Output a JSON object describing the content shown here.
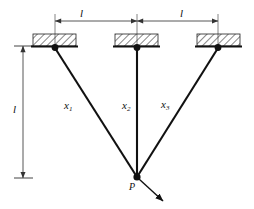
{
  "figure": {
    "type": "statics-diagram",
    "colors": {
      "line": "#111111",
      "background": "#ffffff",
      "dimension": "#555555",
      "hatch": "#222222"
    }
  },
  "dimensions": {
    "top_left_span_label": "l",
    "top_right_span_label": "l",
    "vertical_span_label": "l"
  },
  "members": [
    {
      "name": "bar-1",
      "label": "x",
      "subscript": "1"
    },
    {
      "name": "bar-2",
      "label": "x",
      "subscript": "2"
    },
    {
      "name": "bar-3",
      "label": "x",
      "subscript": "3"
    }
  ],
  "load": {
    "label": "P",
    "direction": "down-right"
  },
  "supports": [
    {
      "name": "support-left",
      "x": 55
    },
    {
      "name": "support-middle",
      "x": 137
    },
    {
      "name": "support-right",
      "x": 218
    }
  ],
  "joint": {
    "name": "load-joint",
    "x": 137,
    "y": 177
  }
}
